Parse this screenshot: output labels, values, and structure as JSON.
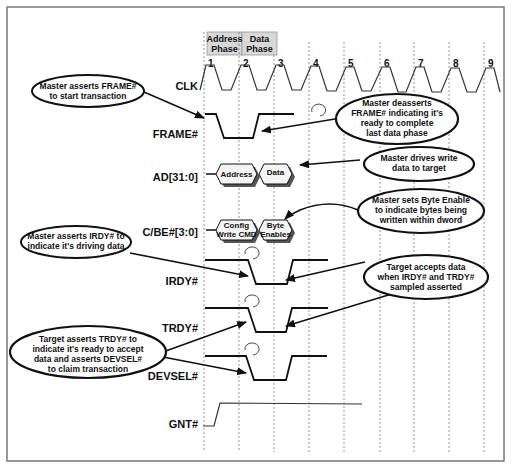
{
  "diagram": {
    "type": "timing-diagram",
    "phases": [
      {
        "label_line1": "Address",
        "label_line2": "Phase"
      },
      {
        "label_line1": "Data",
        "label_line2": "Phase"
      }
    ],
    "clock_numbers": [
      "1",
      "2",
      "3",
      "4",
      "5",
      "6",
      "7",
      "8",
      "9"
    ],
    "signals": [
      {
        "name": "CLK"
      },
      {
        "name": "FRAME#"
      },
      {
        "name": "AD[31:0]"
      },
      {
        "name": "C/BE#[3:0]"
      },
      {
        "name": "IRDY#"
      },
      {
        "name": "TRDY#"
      },
      {
        "name": "DEVSEL#"
      },
      {
        "name": "GNT#"
      }
    ],
    "bus_values": {
      "ad_address": "Address",
      "ad_data": "Data",
      "cbe_cmd_line1": "Config",
      "cbe_cmd_line2": "Write CMD",
      "cbe_be_line1": "Byte",
      "cbe_be_line2": "Enables"
    },
    "callouts": {
      "frame_assert": [
        "Master asserts FRAME#",
        "to start transaction"
      ],
      "frame_deassert": [
        "Master deasserts",
        "FRAME# indicating it's",
        "ready to complete",
        "last data phase"
      ],
      "drive_data": [
        "Master drives write",
        "data to target"
      ],
      "byte_enable": [
        "Master sets Byte Enable",
        "to indicate bytes being",
        "written within dword"
      ],
      "irdy_assert": [
        "Master asserts IRDY# to",
        "indicate it's driving data"
      ],
      "target_accepts": [
        "Target accepts data",
        "when IRDY# and TRDY#",
        "sampled asserted"
      ],
      "trdy_assert": [
        "Target asserts TRDY# to",
        "indicate it's ready to accept",
        "data and asserts DEVSEL#",
        "to claim transaction"
      ]
    }
  }
}
